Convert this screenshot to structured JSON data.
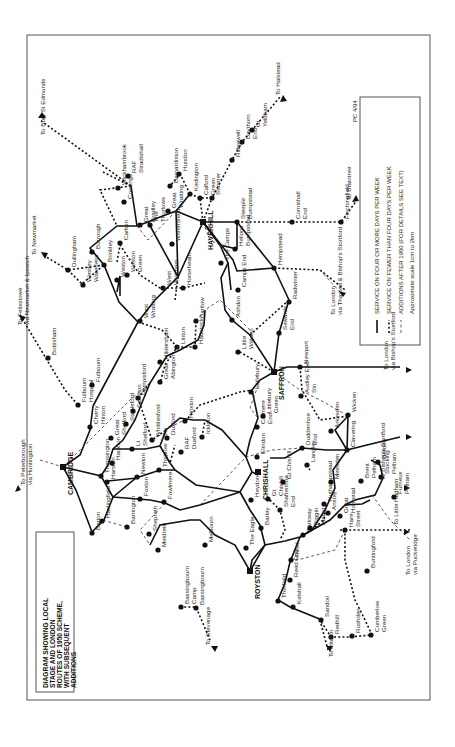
{
  "map": {
    "title_lines": [
      "DIAGRAM SHOWING LOCAL",
      "STAGE AND LONDON",
      "ROUTES OF 1950 SCHEME,",
      "WITH SUBSEQUENT",
      "ADDITIONS"
    ],
    "reference": "PC 4/94",
    "legend": {
      "items": [
        {
          "style": "solid",
          "label": "SERVICE ON FOUR OR MORE DAYS PER WEEK"
        },
        {
          "style": "dot",
          "label": "SERVICE ON FEWER THAN FOUR DAYS PER WEEK"
        },
        {
          "style": "thin",
          "label": "ADDITIONS AFTER 1950 (FOR DETAILS SEE TEXT)"
        }
      ],
      "scale": "Approximate scale 1cm to 2km"
    },
    "towns": [
      {
        "id": "cambridge",
        "label": "CAMBRIDGE",
        "x": 63,
        "y": 467,
        "major": true
      },
      {
        "id": "haverhill",
        "label": "HAVERHILL",
        "x": 203,
        "y": 222,
        "major": true
      },
      {
        "id": "saffron",
        "label": "SAFFRON",
        "x": 274,
        "y": 372,
        "major": true
      },
      {
        "id": "royston",
        "label": "ROYSTON",
        "x": 250,
        "y": 571,
        "major": true
      },
      {
        "id": "chrishall",
        "label": "CHRISHALL",
        "x": 258,
        "y": 472,
        "major": true
      }
    ],
    "places": [
      {
        "label": "Barton",
        "x": 92,
        "y": 533
      },
      {
        "label": "Trumpington",
        "x": 101,
        "y": 476
      },
      {
        "label": "Cherry Hinton",
        "x": 90,
        "y": 427
      },
      {
        "label": "Fulbourn Hospital",
        "x": 78,
        "y": 405
      },
      {
        "label": "Fulbourn",
        "x": 92,
        "y": 385
      },
      {
        "label": "Bottisham",
        "x": 48,
        "y": 358
      },
      {
        "label": "Westley Waterless",
        "x": 83,
        "y": 285
      },
      {
        "label": "Dullingham",
        "x": 68,
        "y": 270
      },
      {
        "label": "Burrough",
        "x": 92,
        "y": 252
      },
      {
        "label": "Brinkley",
        "x": 104,
        "y": 265
      },
      {
        "label": "Weston",
        "x": 117,
        "y": 280
      },
      {
        "label": "West Wratting",
        "x": 140,
        "y": 321
      },
      {
        "label": "Cowlings",
        "x": 124,
        "y": 202
      },
      {
        "label": "Wickhambrook",
        "x": 118,
        "y": 188
      },
      {
        "label": "RAF Stradishall",
        "x": 128,
        "y": 176
      },
      {
        "label": "Great Bradley",
        "x": 140,
        "y": 225
      },
      {
        "label": "The Thurlows",
        "x": 150,
        "y": 225
      },
      {
        "label": "Carlton",
        "x": 120,
        "y": 243
      },
      {
        "label": "Weston Green",
        "x": 127,
        "y": 275
      },
      {
        "label": "Great Wratting",
        "x": 168,
        "y": 211
      },
      {
        "label": "Withersfield",
        "x": 172,
        "y": 244
      },
      {
        "label": "Barnardiston",
        "x": 170,
        "y": 186
      },
      {
        "label": "Hundon",
        "x": 179,
        "y": 174
      },
      {
        "label": "Kedington",
        "x": 190,
        "y": 194
      },
      {
        "label": "Calford Green",
        "x": 200,
        "y": 198
      },
      {
        "label": "Sturmer",
        "x": 212,
        "y": 198
      },
      {
        "label": "Ridgewell",
        "x": 232,
        "y": 160
      },
      {
        "label": "Baythorn End",
        "x": 242,
        "y": 142
      },
      {
        "label": "Gt Yeldham",
        "x": 252,
        "y": 130
      },
      {
        "label": "Steeple Bumpstead",
        "x": 237,
        "y": 222
      },
      {
        "label": "Cornishall End",
        "x": 292,
        "y": 222
      },
      {
        "label": "Finchingfield",
        "x": 341,
        "y": 222
      },
      {
        "label": "Helions Bumpstead",
        "x": 235,
        "y": 249
      },
      {
        "label": "The Camps",
        "x": 221,
        "y": 263
      },
      {
        "label": "Camps End",
        "x": 238,
        "y": 290
      },
      {
        "label": "Hempstead",
        "x": 274,
        "y": 268
      },
      {
        "label": "Radwinter",
        "x": 289,
        "y": 302
      },
      {
        "label": "Sewards End",
        "x": 279,
        "y": 333
      },
      {
        "label": "Ashdon",
        "x": 232,
        "y": 320
      },
      {
        "label": "Little Walden",
        "x": 238,
        "y": 352
      },
      {
        "label": "Horseheath",
        "x": 183,
        "y": 288
      },
      {
        "label": "West Wickham",
        "x": 163,
        "y": 288
      },
      {
        "label": "Bartlow",
        "x": 196,
        "y": 321
      },
      {
        "label": "Linton",
        "x": 177,
        "y": 347
      },
      {
        "label": "Hadstock",
        "x": 195,
        "y": 347
      },
      {
        "label": "Hildersham",
        "x": 160,
        "y": 362
      },
      {
        "label": "Great Abington",
        "x": 160,
        "y": 382
      },
      {
        "label": "Pampisford",
        "x": 138,
        "y": 398
      },
      {
        "label": "Stapleford",
        "x": 126,
        "y": 424
      },
      {
        "label": "Sawston",
        "x": 133,
        "y": 411
      },
      {
        "label": "Great Shelford",
        "x": 111,
        "y": 438
      },
      {
        "label": "Lt Shelford",
        "x": 132,
        "y": 449
      },
      {
        "label": "Whittlesford Stn",
        "x": 152,
        "y": 440
      },
      {
        "label": "Hauxton",
        "x": 112,
        "y": 463
      },
      {
        "label": "Harston",
        "x": 107,
        "y": 482
      },
      {
        "label": "Newton",
        "x": 137,
        "y": 477
      },
      {
        "label": "Thriplow",
        "x": 159,
        "y": 470
      },
      {
        "label": "Duxford",
        "x": 167,
        "y": 438
      },
      {
        "label": "RAF Duxford",
        "x": 181,
        "y": 452
      },
      {
        "label": "Hinxton",
        "x": 185,
        "y": 421
      },
      {
        "label": "Ickleton",
        "x": 202,
        "y": 437
      },
      {
        "label": "Haslingfield",
        "x": 102,
        "y": 521
      },
      {
        "label": "Barrington",
        "x": 127,
        "y": 527
      },
      {
        "label": "Foxton",
        "x": 140,
        "y": 499
      },
      {
        "label": "Fowlmere",
        "x": 164,
        "y": 502
      },
      {
        "label": "Shepreth",
        "x": 149,
        "y": 534
      },
      {
        "label": "Meldreth",
        "x": 158,
        "y": 550
      },
      {
        "label": "Melbourn",
        "x": 205,
        "y": 545
      },
      {
        "label": "Bassingbourn Camp",
        "x": 181,
        "y": 607
      },
      {
        "label": "Bassingbourn",
        "x": 196,
        "y": 608
      },
      {
        "label": "Therfield",
        "x": 278,
        "y": 601
      },
      {
        "label": "Reed End",
        "x": 290,
        "y": 580
      },
      {
        "label": "Kelshall",
        "x": 293,
        "y": 607
      },
      {
        "label": "Sandon",
        "x": 321,
        "y": 620
      },
      {
        "label": "Redhill",
        "x": 331,
        "y": 637
      },
      {
        "label": "Rushden",
        "x": 352,
        "y": 636
      },
      {
        "label": "Cumberlow Green",
        "x": 371,
        "y": 635
      },
      {
        "label": "Buntingford",
        "x": 367,
        "y": 571
      },
      {
        "label": "Reed",
        "x": 291,
        "y": 560
      },
      {
        "label": "The Eagle",
        "x": 246,
        "y": 548
      },
      {
        "label": "Barley",
        "x": 261,
        "y": 528
      },
      {
        "label": "Heydon",
        "x": 251,
        "y": 500
      },
      {
        "label": "Gt Chishill",
        "x": 268,
        "y": 499
      },
      {
        "label": "Shaftenhoe End",
        "x": 280,
        "y": 510
      },
      {
        "label": "Barkway",
        "x": 303,
        "y": 535
      },
      {
        "label": "Biggin Manor",
        "x": 310,
        "y": 528
      },
      {
        "label": "Nuthampstead",
        "x": 324,
        "y": 504
      },
      {
        "label": "Anstey",
        "x": 328,
        "y": 513
      },
      {
        "label": "Great Hormead",
        "x": 340,
        "y": 516
      },
      {
        "label": "Hare Street",
        "x": 345,
        "y": 530
      },
      {
        "label": "Meesden",
        "x": 331,
        "y": 482
      },
      {
        "label": "Langley",
        "x": 307,
        "y": 465
      },
      {
        "label": "Duddenhoe End",
        "x": 302,
        "y": 448
      },
      {
        "label": "Elmdon",
        "x": 257,
        "y": 457
      },
      {
        "label": "Catmere End",
        "x": 257,
        "y": 427
      },
      {
        "label": "Littlebury Green",
        "x": 263,
        "y": 416
      },
      {
        "label": "Littlebury",
        "x": 251,
        "y": 392
      },
      {
        "label": "Audley End Stn",
        "x": 301,
        "y": 396
      },
      {
        "label": "Newport",
        "x": 300,
        "y": 367
      },
      {
        "label": "Arkesden",
        "x": 331,
        "y": 431
      },
      {
        "label": "Wicken",
        "x": 348,
        "y": 415
      },
      {
        "label": "Clavering",
        "x": 347,
        "y": 450
      },
      {
        "label": "Berden",
        "x": 378,
        "y": 462
      },
      {
        "label": "Stocking Pelham",
        "x": 381,
        "y": 477
      },
      {
        "label": "Brent Pelham",
        "x": 361,
        "y": 481
      },
      {
        "label": "Furneux Pelham",
        "x": 394,
        "y": 497
      },
      {
        "label": "Gt Chishill ",
        "x": 283,
        "y": 482
      }
    ],
    "offmap_arrows": [
      {
        "label": "To Peterborough via Huntingdon",
        "x": 25,
        "y": 485
      },
      {
        "label": "To Felixstowe via Newmarket & Ipswich",
        "x": 22,
        "y": 325
      },
      {
        "label": "To Newmarket",
        "x": 36,
        "y": 255
      },
      {
        "label": "To Bury St Edmunds",
        "x": 45,
        "y": 135
      },
      {
        "label": "To Halstead",
        "x": 280,
        "y": 95
      },
      {
        "label": "To Braintree",
        "x": 351,
        "y": 200
      },
      {
        "label": "To London via Thaxted & Bishop's Stortford",
        "x": 335,
        "y": 315
      },
      {
        "label": "To London via Bishop's Stortford",
        "x": 388,
        "y": 370
      },
      {
        "label": "To Bishop's Stortford",
        "x": 385,
        "y": 480
      },
      {
        "label": "To Little Hadham",
        "x": 398,
        "y": 525
      },
      {
        "label": "To London via Puckeridge",
        "x": 410,
        "y": 575
      },
      {
        "label": "To Hitchin",
        "x": 333,
        "y": 657
      },
      {
        "label": "To Stevenage",
        "x": 210,
        "y": 645
      }
    ]
  }
}
